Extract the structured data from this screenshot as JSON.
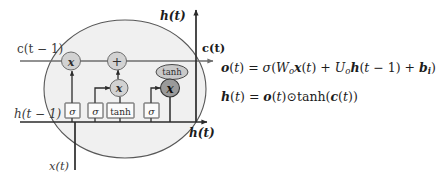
{
  "figure": {
    "kind": "lstm-cell-diagram",
    "cell_fill": "#f0f0f0",
    "cell_stroke": "#555555",
    "line_color": "#6e6e6e",
    "line_color_dark": "#2b2b2b",
    "node_fill": "#d2d2d2",
    "node_fill_dark": "#9a9a9a",
    "gate_fill": "#fbfbfb",
    "text_color": "#3a3a3a"
  },
  "labels": {
    "c_prev": "c(t − 1)",
    "h_prev": "h(t − 1)",
    "x_in": "x(t)",
    "c_out": "c(t)",
    "h_out_top": "h(t)",
    "h_out_right": "h(t)"
  },
  "gates": [
    {
      "id": "forget-gate",
      "label": "σ",
      "x": 72,
      "y": 110
    },
    {
      "id": "input-gate",
      "label": "σ",
      "x": 95,
      "y": 110
    },
    {
      "id": "candidate-gate",
      "label": "tanh",
      "x": 120,
      "y": 110
    },
    {
      "id": "output-gate",
      "label": "σ",
      "x": 151,
      "y": 110
    }
  ],
  "operators": [
    {
      "id": "forget-multiply",
      "label": "𝒙",
      "shape": "ellipse",
      "x": 71,
      "y": 61,
      "tone": "light"
    },
    {
      "id": "state-add",
      "label": "+",
      "shape": "ellipse",
      "x": 117,
      "y": 61,
      "tone": "light"
    },
    {
      "id": "input-multiply",
      "label": "𝒙",
      "shape": "ellipse",
      "x": 120,
      "y": 88,
      "tone": "light"
    },
    {
      "id": "output-multiply",
      "label": "𝒙",
      "shape": "ellipse",
      "x": 170,
      "y": 88,
      "tone": "dark"
    },
    {
      "id": "output-tanh",
      "label": "tanh",
      "shape": "ellipse-wide",
      "x": 172,
      "y": 72,
      "tone": "light"
    }
  ],
  "equations": {
    "output_gate": {
      "lhs": "o(t)",
      "rhs": "σ(Wₒx(t) + Uₒh(t − 1) + bᵢ)",
      "full": "o(t) = σ(Wₒx(t) + Uₒh(t − 1) + bᵢ)"
    },
    "hidden_state": {
      "lhs": "h(t)",
      "rhs": "o(t)⊙tanh(c(t))",
      "full": "h(t) = o(t)⊙tanh(c(t))"
    }
  }
}
